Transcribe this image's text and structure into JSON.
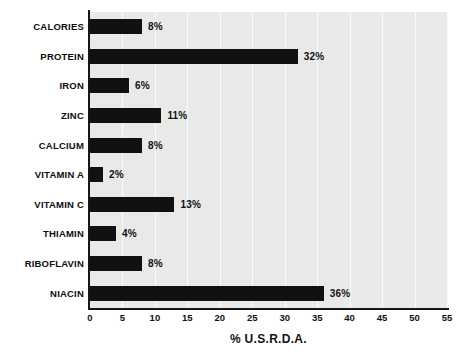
{
  "chart_data": {
    "type": "bar",
    "orientation": "horizontal",
    "title": "",
    "xlabel": "% U.S.R.D.A.",
    "ylabel": "",
    "xlim": [
      0,
      55
    ],
    "xticks": [
      0,
      5,
      10,
      15,
      20,
      25,
      30,
      35,
      40,
      45,
      50,
      55
    ],
    "grid": true,
    "grid_axis": "x",
    "legend": false,
    "categories": [
      "CALORIES",
      "PROTEIN",
      "IRON",
      "ZINC",
      "CALCIUM",
      "VITAMIN A",
      "VITAMIN C",
      "THIAMIN",
      "RIBOFLAVIN",
      "NIACIN"
    ],
    "values": [
      8,
      32,
      6,
      11,
      8,
      2,
      13,
      4,
      8,
      36
    ],
    "data_labels": [
      "8%",
      "32%",
      "6%",
      "11%",
      "8%",
      "2%",
      "13%",
      "4%",
      "8%",
      "36%"
    ],
    "bars": [
      {
        "category": "CALORIES",
        "value": 8,
        "label": "8%"
      },
      {
        "category": "PROTEIN",
        "value": 32,
        "label": "32%"
      },
      {
        "category": "IRON",
        "value": 6,
        "label": "6%"
      },
      {
        "category": "ZINC",
        "value": 11,
        "label": "11%"
      },
      {
        "category": "CALCIUM",
        "value": 8,
        "label": "8%"
      },
      {
        "category": "VITAMIN A",
        "value": 2,
        "label": "2%"
      },
      {
        "category": "VITAMIN C",
        "value": 13,
        "label": "13%"
      },
      {
        "category": "THIAMIN",
        "value": 4,
        "label": "4%"
      },
      {
        "category": "RIBOFLAVIN",
        "value": 8,
        "label": "8%"
      },
      {
        "category": "NIACIN",
        "value": 36,
        "label": "36%"
      }
    ]
  },
  "colors": {
    "bar": "#111111",
    "plot_background": "#e9e9e9",
    "page_background": "#ffffff",
    "gridline": "#fbfbfb",
    "axis": "#171717",
    "text": "#111111"
  }
}
